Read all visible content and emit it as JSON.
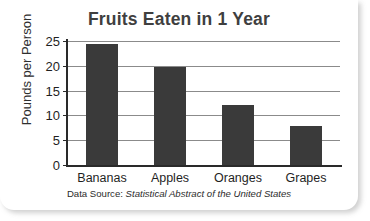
{
  "chart_data": {
    "type": "bar",
    "title": "Fruits Eaten in 1 Year",
    "xlabel": "",
    "ylabel": "Pounds per Person",
    "categories": [
      "Bananas",
      "Apples",
      "Oranges",
      "Grapes"
    ],
    "values": [
      24.3,
      19.7,
      12.2,
      7.8
    ],
    "ylim": [
      0,
      25
    ],
    "yticks": [
      0,
      5,
      10,
      15,
      20,
      25
    ],
    "ytick_labels": [
      "0",
      "5",
      "10",
      "15",
      "20",
      "25"
    ],
    "grid": true,
    "legend": false,
    "bar_color": "#3a3a3a",
    "title_color": "#3f3f3f",
    "gridline_color": "#8b8b8b",
    "axis_color": "#2a2a2a"
  },
  "source": {
    "prefix": "Data Source:",
    "publication": "Statistical Abstract of the United States"
  }
}
